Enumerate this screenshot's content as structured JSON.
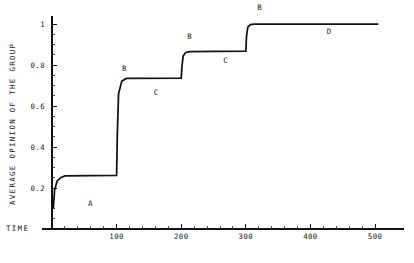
{
  "chart_data": {
    "type": "line",
    "title": "",
    "xlabel": "TIME",
    "ylabel": "AVERAGE OPINION OF THE GROUP",
    "xlim": [
      0,
      520
    ],
    "ylim": [
      0,
      1.04
    ],
    "grid": false,
    "legend": null,
    "x_ticks": [
      0,
      100,
      200,
      300,
      400,
      500
    ],
    "x_tick_labels": [
      "",
      "100",
      "200",
      "300",
      "400",
      "500"
    ],
    "x_minor_step": 20,
    "y_ticks": [
      0.2,
      0.4,
      0.6,
      0.8,
      1
    ],
    "y_tick_labels": [
      "0.2",
      "0.4",
      "0.6",
      "0.8",
      "1"
    ],
    "y_minor_step": 0.05,
    "series": [
      {
        "name": "average opinion",
        "x": [
          2,
          4,
          8,
          14,
          20,
          100,
          101,
          103,
          108,
          115,
          200,
          201,
          203,
          207,
          213,
          300,
          301,
          303,
          307,
          313,
          505
        ],
        "values": [
          0.1,
          0.19,
          0.235,
          0.252,
          0.259,
          0.262,
          0.45,
          0.66,
          0.722,
          0.735,
          0.737,
          0.79,
          0.845,
          0.862,
          0.866,
          0.868,
          0.94,
          0.985,
          0.998,
          1.0,
          1.0
        ]
      }
    ],
    "annotations": [
      {
        "text": "A",
        "x": 0.218,
        "y": 0.782,
        "note": "plateau-a-label"
      },
      {
        "text": "B",
        "x": 0.3,
        "y": 0.268,
        "note": "transition-b1-label"
      },
      {
        "text": "C",
        "x": 0.377,
        "y": 0.36,
        "note": "plateau-c1-label"
      },
      {
        "text": "B",
        "x": 0.458,
        "y": 0.15,
        "note": "transition-b2-label"
      },
      {
        "text": "C",
        "x": 0.545,
        "y": 0.24,
        "note": "plateau-c2-label"
      },
      {
        "text": "B",
        "x": 0.627,
        "y": 0.038,
        "note": "transition-b3-label"
      },
      {
        "text": "D",
        "x": 0.795,
        "y": 0.13,
        "note": "plateau-d-label"
      }
    ]
  },
  "geometry": {
    "plot_left": 52,
    "plot_right": 388,
    "plot_top": 16,
    "plot_bottom": 229,
    "x_value_max": 520,
    "y_value_max": 1.04
  }
}
